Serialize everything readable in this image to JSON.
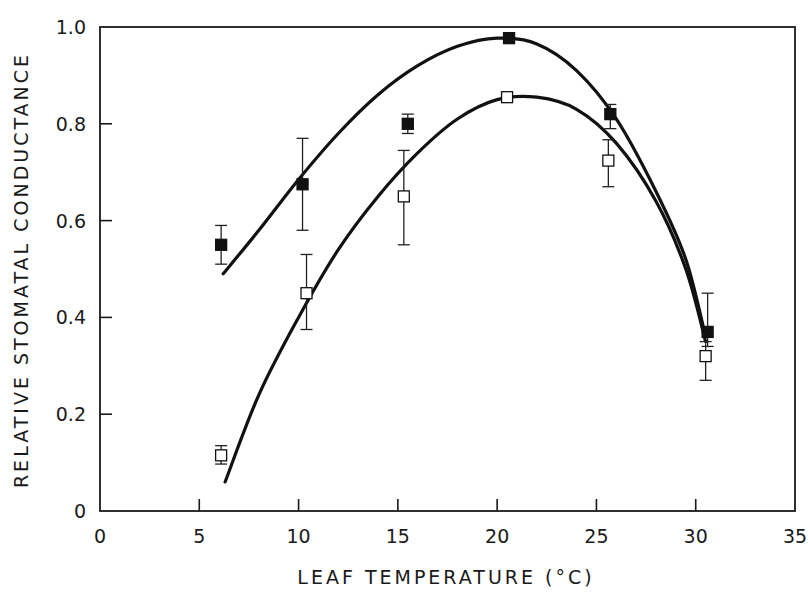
{
  "chart_data": {
    "type": "scatter",
    "title": "",
    "xlabel": "LEAF TEMPERATURE (°C)",
    "ylabel": "RELATIVE STOMATAL CONDUCTANCE",
    "xlim": [
      0,
      35
    ],
    "ylim": [
      0,
      1.0
    ],
    "x_ticks": [
      0,
      5,
      10,
      15,
      20,
      25,
      30,
      35
    ],
    "x_tick_labels": [
      "0",
      "5",
      "10",
      "15",
      "20",
      "25",
      "30",
      "35"
    ],
    "y_ticks": [
      0,
      0.2,
      0.4,
      0.6,
      0.8,
      1.0
    ],
    "y_tick_labels": [
      "0",
      "0.2",
      "0.4",
      "0.6",
      "0.8",
      "1.0"
    ],
    "grid": false,
    "legend": null,
    "series": [
      {
        "name": "filled squares",
        "marker": "filled-square",
        "points": [
          {
            "x": 6.1,
            "y": 0.55,
            "err_low": 0.51,
            "err_high": 0.59
          },
          {
            "x": 10.2,
            "y": 0.675,
            "err_low": 0.58,
            "err_high": 0.77
          },
          {
            "x": 15.5,
            "y": 0.8,
            "err_low": 0.78,
            "err_high": 0.82
          },
          {
            "x": 20.6,
            "y": 0.977,
            "err_low": null,
            "err_high": null
          },
          {
            "x": 25.7,
            "y": 0.82,
            "err_low": 0.79,
            "err_high": 0.84
          },
          {
            "x": 30.6,
            "y": 0.37,
            "err_low": 0.34,
            "err_high": 0.45
          }
        ],
        "fit_curve": [
          [
            6.2,
            0.49
          ],
          [
            8,
            0.58
          ],
          [
            10,
            0.685
          ],
          [
            12,
            0.78
          ],
          [
            14,
            0.86
          ],
          [
            16,
            0.92
          ],
          [
            18,
            0.96
          ],
          [
            20,
            0.977
          ],
          [
            22,
            0.965
          ],
          [
            24,
            0.91
          ],
          [
            26,
            0.81
          ],
          [
            28,
            0.66
          ],
          [
            29.5,
            0.52
          ],
          [
            30.5,
            0.36
          ]
        ]
      },
      {
        "name": "open squares",
        "marker": "open-square",
        "points": [
          {
            "x": 6.1,
            "y": 0.115,
            "err_low": 0.097,
            "err_high": 0.135
          },
          {
            "x": 10.4,
            "y": 0.45,
            "err_low": 0.375,
            "err_high": 0.53
          },
          {
            "x": 15.3,
            "y": 0.65,
            "err_low": 0.55,
            "err_high": 0.745
          },
          {
            "x": 20.5,
            "y": 0.855,
            "err_low": null,
            "err_high": null
          },
          {
            "x": 25.6,
            "y": 0.724,
            "err_low": 0.67,
            "err_high": 0.767
          },
          {
            "x": 30.5,
            "y": 0.32,
            "err_low": 0.27,
            "err_high": 0.35
          }
        ],
        "fit_curve": [
          [
            6.3,
            0.06
          ],
          [
            8,
            0.24
          ],
          [
            10,
            0.4
          ],
          [
            12,
            0.54
          ],
          [
            14,
            0.65
          ],
          [
            16,
            0.74
          ],
          [
            18,
            0.81
          ],
          [
            20,
            0.85
          ],
          [
            22,
            0.855
          ],
          [
            24,
            0.83
          ],
          [
            26,
            0.76
          ],
          [
            28,
            0.64
          ],
          [
            29.5,
            0.5
          ],
          [
            30.5,
            0.35
          ]
        ]
      }
    ]
  }
}
